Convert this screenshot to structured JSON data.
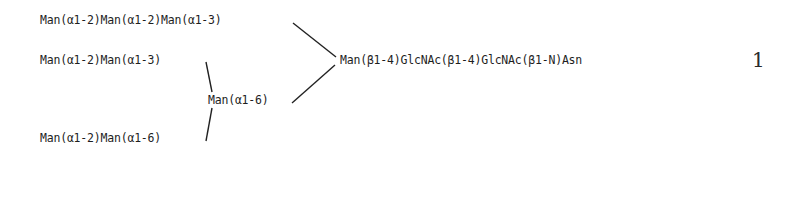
{
  "structure": {
    "arm_a_top": "Man(α1-2)Man(α1-2)Man(α1-3)",
    "arm_b_upper": "Man(α1-2)Man(α1-3)",
    "branch_node": "Man(α1-6)",
    "arm_b_lower": "Man(α1-2)Man(α1-6)",
    "core": "Man(β1-4)GlcNAc(β1-4)GlcNAc(β1-N)Asn"
  },
  "compound_number": "1",
  "colors": {
    "ink": "#1e1e1e",
    "background": "#ffffff"
  }
}
